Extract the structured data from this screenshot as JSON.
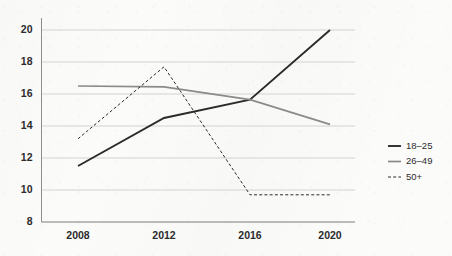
{
  "chart_data": {
    "type": "line",
    "title": "",
    "subtitle": "",
    "xlabel": "",
    "ylabel": "",
    "categories": [
      "2008",
      "2012",
      "2016",
      "2020"
    ],
    "x": [
      2008,
      2012,
      2016,
      2020
    ],
    "xlim": [
      2008,
      2020
    ],
    "ylim": [
      8,
      20
    ],
    "yticks": [
      8,
      10,
      12,
      14,
      16,
      18,
      20
    ],
    "ytick_labels": [
      "8",
      "10",
      "12",
      "14",
      "16",
      "18",
      "20"
    ],
    "xtick_labels": [
      "2008",
      "2012",
      "2016",
      "2020"
    ],
    "grid": "horizontal",
    "legend_position": "right",
    "series": [
      {
        "name": "18–25",
        "values": [
          11.5,
          14.5,
          15.65,
          20.0
        ],
        "color": "#2b2b2b",
        "style": "solid",
        "width": 1.9
      },
      {
        "name": "26–49",
        "values": [
          16.5,
          16.45,
          15.65,
          14.1
        ],
        "color": "#8a8a8a",
        "style": "solid",
        "width": 1.7
      },
      {
        "name": "50+",
        "values": [
          13.2,
          17.7,
          9.7,
          9.7
        ],
        "color": "#2b2b2b",
        "style": "dashed",
        "width": 1.0
      }
    ]
  },
  "legend": {
    "items": [
      {
        "label": "18–25",
        "swatch": "solid-dark-line-swatch"
      },
      {
        "label": "26–49",
        "swatch": "solid-gray-line-swatch"
      },
      {
        "label": "50+",
        "swatch": "dashed-dark-line-swatch"
      }
    ]
  },
  "colors": {
    "background": "#fbfbfa",
    "grid": "#c9c9c9",
    "axis": "#8f8f8f",
    "text": "#2b2b2b",
    "series_dark": "#2b2b2b",
    "series_gray": "#8a8a8a"
  }
}
